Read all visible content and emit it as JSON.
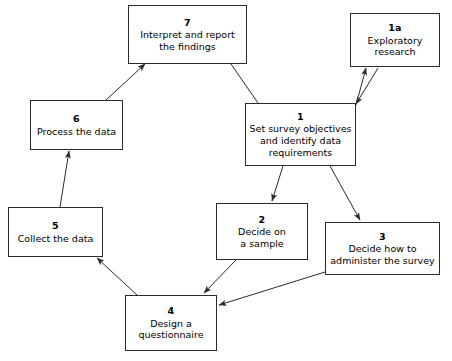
{
  "diagram": {
    "type": "flowchart",
    "background_color": "#ffffff",
    "box_border_color": "#2b2b2b",
    "connector_color": "#2b2b2b",
    "nodes": [
      {
        "id": "n7",
        "number": "7",
        "label": "Interpret and report\nthe findings",
        "x": 128,
        "y": 5,
        "w": 119,
        "h": 59
      },
      {
        "id": "n1a",
        "number": "1a",
        "label": "Exploratory\nresearch",
        "x": 350,
        "y": 13,
        "w": 90,
        "h": 54
      },
      {
        "id": "n1",
        "number": "1",
        "label": "Set survey objectives\nand identify data\nrequirements",
        "x": 245,
        "y": 103,
        "w": 111,
        "h": 63
      },
      {
        "id": "n6",
        "number": "6",
        "label": "Process the data",
        "x": 30,
        "y": 100,
        "w": 93,
        "h": 50
      },
      {
        "id": "n5",
        "number": "5",
        "label": "Collect the data",
        "x": 8,
        "y": 207,
        "w": 95,
        "h": 50
      },
      {
        "id": "n2",
        "number": "2",
        "label": "Decide on\na sample",
        "x": 216,
        "y": 203,
        "w": 92,
        "h": 57
      },
      {
        "id": "n3",
        "number": "3",
        "label": "Decide how to\nadminister the survey",
        "x": 325,
        "y": 222,
        "w": 115,
        "h": 53
      },
      {
        "id": "n4",
        "number": "4",
        "label": "Design a\nquestionnaire",
        "x": 125,
        "y": 295,
        "w": 92,
        "h": 56
      }
    ],
    "connectors": [
      {
        "id": "c1",
        "from": "n7",
        "to": "n1",
        "arrow": "none",
        "x1": 231,
        "y1": 64,
        "x2": 258,
        "y2": 103
      },
      {
        "id": "c2",
        "from": "n1",
        "to": "n1a",
        "arrow": "end",
        "x1": 356,
        "y1": 105,
        "x2": 366,
        "y2": 68
      },
      {
        "id": "c3",
        "from": "n1a",
        "to": "n1",
        "arrow": "end",
        "x1": 378,
        "y1": 68,
        "x2": 356,
        "y2": 104
      },
      {
        "id": "c4",
        "from": "n1",
        "to": "n2",
        "arrow": "end",
        "x1": 283,
        "y1": 166,
        "x2": 272,
        "y2": 201
      },
      {
        "id": "c5",
        "from": "n1",
        "to": "n3",
        "arrow": "end",
        "x1": 330,
        "y1": 166,
        "x2": 360,
        "y2": 220
      },
      {
        "id": "c6",
        "from": "n2",
        "to": "n4",
        "arrow": "end",
        "x1": 236,
        "y1": 260,
        "x2": 204,
        "y2": 293
      },
      {
        "id": "c7",
        "from": "n3",
        "to": "n4",
        "arrow": "end",
        "x1": 325,
        "y1": 272,
        "x2": 219,
        "y2": 305
      },
      {
        "id": "c8",
        "from": "n4",
        "to": "n5",
        "arrow": "end",
        "x1": 137,
        "y1": 295,
        "x2": 97,
        "y2": 258
      },
      {
        "id": "c9",
        "from": "n5",
        "to": "n6",
        "arrow": "end",
        "x1": 60,
        "y1": 207,
        "x2": 69,
        "y2": 151
      },
      {
        "id": "c10",
        "from": "n6",
        "to": "n7",
        "arrow": "end",
        "x1": 106,
        "y1": 100,
        "x2": 145,
        "y2": 64
      }
    ]
  }
}
